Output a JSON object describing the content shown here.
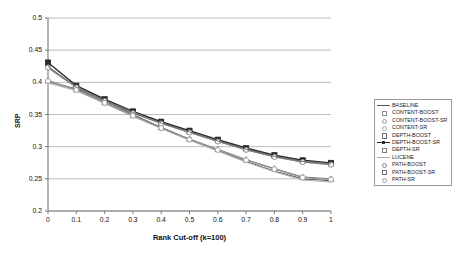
{
  "chart_data": {
    "type": "line",
    "title": "",
    "xlabel": "Rank Cut-off (k=100)",
    "ylabel": "SRP",
    "xlim": [
      0,
      1
    ],
    "ylim": [
      0.2,
      0.5
    ],
    "grid": true,
    "legend_position": "right",
    "x": [
      0,
      0.1,
      0.2,
      0.3,
      0.4,
      0.5,
      0.6,
      0.7,
      0.8,
      0.9,
      1
    ],
    "xticks": [
      "0",
      "0.1",
      "0.2",
      "0.3",
      "0.4",
      "0.5",
      "0.6",
      "0.7",
      "0.8",
      "0.9",
      "1"
    ],
    "yticks": [
      "0.2",
      "0.25",
      "0.3",
      "0.35",
      "0.4",
      "0.45",
      "0.5"
    ],
    "series": [
      {
        "name": "BASELINE",
        "color": "#555555",
        "marker": "dash",
        "values": [
          0.4,
          0.39,
          0.371,
          0.35,
          0.33,
          0.311,
          0.294,
          0.277,
          0.262,
          0.25,
          0.247
        ]
      },
      {
        "name": "CONTENT-BOOST",
        "color": "#8c8c8c",
        "marker": "open-square",
        "values": [
          0.422,
          0.392,
          0.371,
          0.352,
          0.336,
          0.322,
          0.308,
          0.295,
          0.284,
          0.276,
          0.272
        ]
      },
      {
        "name": "CONTENT-BOOST-SR",
        "color": "#9a9a9a",
        "marker": "open-circle",
        "values": [
          0.424,
          0.393,
          0.372,
          0.353,
          0.337,
          0.323,
          0.309,
          0.296,
          0.285,
          0.277,
          0.273
        ]
      },
      {
        "name": "CONTENT-SR",
        "color": "#a8a8a8",
        "marker": "open-circle",
        "values": [
          0.401,
          0.388,
          0.368,
          0.348,
          0.329,
          0.311,
          0.295,
          0.279,
          0.265,
          0.252,
          0.249
        ]
      },
      {
        "name": "DEPTH-BOOST",
        "color": "#6e6e6e",
        "marker": "open-square",
        "values": [
          0.43,
          0.394,
          0.373,
          0.354,
          0.338,
          0.324,
          0.31,
          0.297,
          0.286,
          0.278,
          0.274
        ]
      },
      {
        "name": "DEPTH-BOOST-SR",
        "color": "#2b2b2b",
        "marker": "filled-diamond",
        "values": [
          0.431,
          0.395,
          0.374,
          0.355,
          0.339,
          0.325,
          0.311,
          0.298,
          0.287,
          0.279,
          0.275
        ]
      },
      {
        "name": "DEPTH-SR",
        "color": "#7c7c7c",
        "marker": "open-triangle",
        "values": [
          0.403,
          0.389,
          0.369,
          0.349,
          0.33,
          0.312,
          0.296,
          0.28,
          0.266,
          0.253,
          0.25
        ]
      },
      {
        "name": "LUCENE",
        "color": "#b0b0b0",
        "marker": "dash",
        "values": [
          0.399,
          0.387,
          0.367,
          0.347,
          0.328,
          0.31,
          0.293,
          0.276,
          0.261,
          0.248,
          0.245
        ]
      },
      {
        "name": "PATH-BOOST",
        "color": "#858585",
        "marker": "open-circle",
        "values": [
          0.423,
          0.392,
          0.371,
          0.352,
          0.336,
          0.322,
          0.308,
          0.295,
          0.284,
          0.276,
          0.272
        ]
      },
      {
        "name": "PATH-BOOST-SR",
        "color": "#707070",
        "marker": "open-square",
        "values": [
          0.425,
          0.393,
          0.372,
          0.353,
          0.337,
          0.323,
          0.309,
          0.296,
          0.285,
          0.277,
          0.273
        ]
      },
      {
        "name": "PATH-SR",
        "color": "#999999",
        "marker": "open-circle",
        "values": [
          0.402,
          0.388,
          0.368,
          0.348,
          0.329,
          0.311,
          0.295,
          0.279,
          0.265,
          0.252,
          0.249
        ]
      }
    ]
  }
}
